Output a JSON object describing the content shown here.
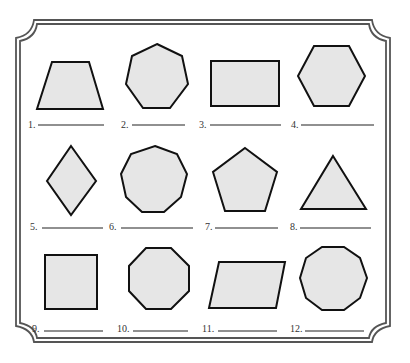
{
  "worksheet": {
    "title": "",
    "colors": {
      "shape_fill": "#e6e6e6",
      "shape_stroke": "#111111",
      "frame": "#555555",
      "background": "#ffffff"
    },
    "items": [
      {
        "number": "1.",
        "shape": "trapezoid",
        "sides": 4,
        "answer": ""
      },
      {
        "number": "2.",
        "shape": "heptagon",
        "sides": 7,
        "answer": ""
      },
      {
        "number": "3.",
        "shape": "rectangle",
        "sides": 4,
        "answer": ""
      },
      {
        "number": "4.",
        "shape": "hexagon",
        "sides": 6,
        "answer": ""
      },
      {
        "number": "5.",
        "shape": "rhombus",
        "sides": 4,
        "answer": ""
      },
      {
        "number": "6.",
        "shape": "nonagon",
        "sides": 9,
        "answer": ""
      },
      {
        "number": "7.",
        "shape": "pentagon",
        "sides": 5,
        "answer": ""
      },
      {
        "number": "8.",
        "shape": "triangle",
        "sides": 3,
        "answer": ""
      },
      {
        "number": "9.",
        "shape": "square",
        "sides": 4,
        "answer": ""
      },
      {
        "number": "10.",
        "shape": "octagon",
        "sides": 8,
        "answer": ""
      },
      {
        "number": "11.",
        "shape": "parallelogram",
        "sides": 4,
        "answer": ""
      },
      {
        "number": "12.",
        "shape": "decagon",
        "sides": 10,
        "answer": ""
      }
    ]
  }
}
